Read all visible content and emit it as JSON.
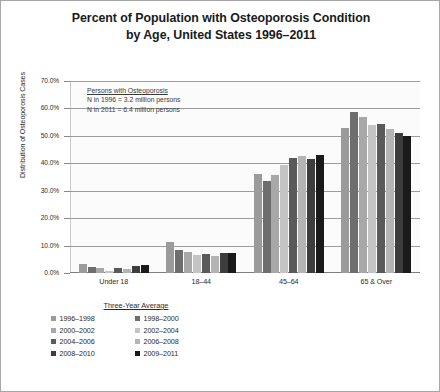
{
  "chart_data": {
    "type": "bar",
    "title": "Percent of Population with Osteoporosis Condition by Age, United States 1996–2011",
    "title_line_1": "Percent of Population with Osteoporosis Condition",
    "title_line_2": "by Age, United States 1996–2011",
    "xlabel": "",
    "ylabel": "Distribution of Osteoporosis Cases",
    "ylim": [
      0,
      70
    ],
    "ytick_labels": [
      "70.0%",
      "60.0%",
      "50.0%",
      "40.0%",
      "30.0%",
      "20.0%",
      "10.0%",
      "0.0%"
    ],
    "ytick_values": [
      70,
      60,
      50,
      40,
      30,
      20,
      10,
      0
    ],
    "grid": true,
    "legend_position": "below-left",
    "legend_title": "Three-Year Average",
    "categories": [
      "Under 18",
      "18–44",
      "45–64",
      "65 & Over"
    ],
    "series": [
      {
        "name": "1996–1998",
        "color": "#9b9b9b",
        "values": [
          3.4,
          11.2,
          36.0,
          53.0
        ]
      },
      {
        "name": "1998–2000",
        "color": "#6e6e6e",
        "values": [
          2.3,
          8.4,
          33.5,
          58.8
        ]
      },
      {
        "name": "2000–2002",
        "color": "#a8a8a8",
        "values": [
          1.8,
          7.6,
          35.8,
          57.0
        ]
      },
      {
        "name": "2002–2004",
        "color": "#c4c4c4",
        "values": [
          0.9,
          6.4,
          39.5,
          54.0
        ]
      },
      {
        "name": "2004–2006",
        "color": "#5a5a5a",
        "values": [
          1.9,
          7.0,
          42.0,
          54.2
        ]
      },
      {
        "name": "2006–2008",
        "color": "#b4b4b4",
        "values": [
          1.5,
          6.2,
          42.8,
          52.6
        ]
      },
      {
        "name": "2008–2010",
        "color": "#3d3d3d",
        "values": [
          2.7,
          7.3,
          41.7,
          51.2
        ]
      },
      {
        "name": "2009–2011",
        "color": "#1a1a1a",
        "values": [
          2.9,
          7.2,
          43.0,
          49.8
        ]
      }
    ]
  },
  "annotation": {
    "title": "Persons with Osteoporosis",
    "line_1": "N  in 1996 = 3.2 million persons",
    "line_2": "N  in 2011 = 6.4 million persons"
  }
}
